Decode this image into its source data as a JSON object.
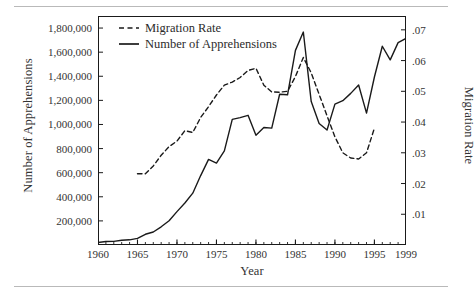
{
  "chart_data": {
    "type": "line",
    "title": "",
    "xlabel": "Year",
    "ylabel": "Number of Apprehensions",
    "y2label": "Migration Rate",
    "xlim": [
      1960,
      1999
    ],
    "ylim": [
      0,
      1900000
    ],
    "y2lim": [
      0,
      0.0745
    ],
    "grid": false,
    "legend_position": "top-left",
    "ytick_labels": [
      "200,000",
      "400,000",
      "600,000",
      "800,000",
      "1,000,000",
      "1,200,000",
      "1,400,000",
      "1,600,000",
      "1,800,000"
    ],
    "ytick_values": [
      200000,
      400000,
      600000,
      800000,
      1000000,
      1200000,
      1400000,
      1600000,
      1800000
    ],
    "y2tick_labels": [
      ".01",
      ".02",
      ".03",
      ".04",
      ".05",
      ".06",
      ".07"
    ],
    "y2tick_values": [
      0.01,
      0.02,
      0.03,
      0.04,
      0.05,
      0.06,
      0.07
    ],
    "xtick_labels": [
      "1960",
      "1965",
      "1970",
      "1975",
      "1980",
      "1985",
      "1990",
      "1995",
      "1999"
    ],
    "xtick_values": [
      1960,
      1965,
      1970,
      1975,
      1980,
      1985,
      1990,
      1995,
      1999
    ],
    "minor_xticks": true,
    "series": [
      {
        "name": "Number of Apprehensions",
        "style": "solid",
        "axis": "left",
        "color": "#1a1a1a",
        "x": [
          1960,
          1961,
          1962,
          1963,
          1964,
          1965,
          1966,
          1967,
          1968,
          1969,
          1970,
          1971,
          1972,
          1973,
          1974,
          1975,
          1976,
          1977,
          1978,
          1979,
          1980,
          1981,
          1982,
          1983,
          1984,
          1985,
          1986,
          1987,
          1988,
          1989,
          1990,
          1991,
          1992,
          1993,
          1994,
          1995,
          1996,
          1997,
          1998,
          1999
        ],
        "values": [
          21000,
          29000,
          30000,
          39000,
          43000,
          55000,
          89000,
          108000,
          151000,
          201000,
          277000,
          348000,
          430000,
          576000,
          710000,
          680000,
          781000,
          1042000,
          1057000,
          1076000,
          910000,
          975000,
          970000,
          1251000,
          1246000,
          1615000,
          1767000,
          1190000,
          1008000,
          954000,
          1169000,
          1197000,
          1258000,
          1327000,
          1094000,
          1394000,
          1649000,
          1536000,
          1679000,
          1714000
        ]
      },
      {
        "name": "Migration Rate",
        "style": "dashed",
        "axis": "right",
        "color": "#1a1a1a",
        "x": [
          1965,
          1966,
          1967,
          1968,
          1969,
          1970,
          1971,
          1972,
          1973,
          1974,
          1975,
          1976,
          1977,
          1978,
          1979,
          1980,
          1981,
          1982,
          1983,
          1984,
          1985,
          1986,
          1987,
          1988,
          1989,
          1990,
          1991,
          1992,
          1993,
          1994,
          1995
        ],
        "values": [
          0.0232,
          0.0232,
          0.0257,
          0.0292,
          0.032,
          0.0338,
          0.0372,
          0.0366,
          0.0415,
          0.045,
          0.0488,
          0.052,
          0.053,
          0.0545,
          0.0568,
          0.0575,
          0.052,
          0.0498,
          0.0497,
          0.05,
          0.0548,
          0.061,
          0.056,
          0.049,
          0.042,
          0.0352,
          0.03,
          0.0283,
          0.028,
          0.03,
          0.038
        ]
      }
    ]
  },
  "legend": {
    "items": [
      {
        "label": "Migration Rate",
        "style": "dashed"
      },
      {
        "label": "Number of Apprehensions",
        "style": "solid"
      }
    ]
  }
}
